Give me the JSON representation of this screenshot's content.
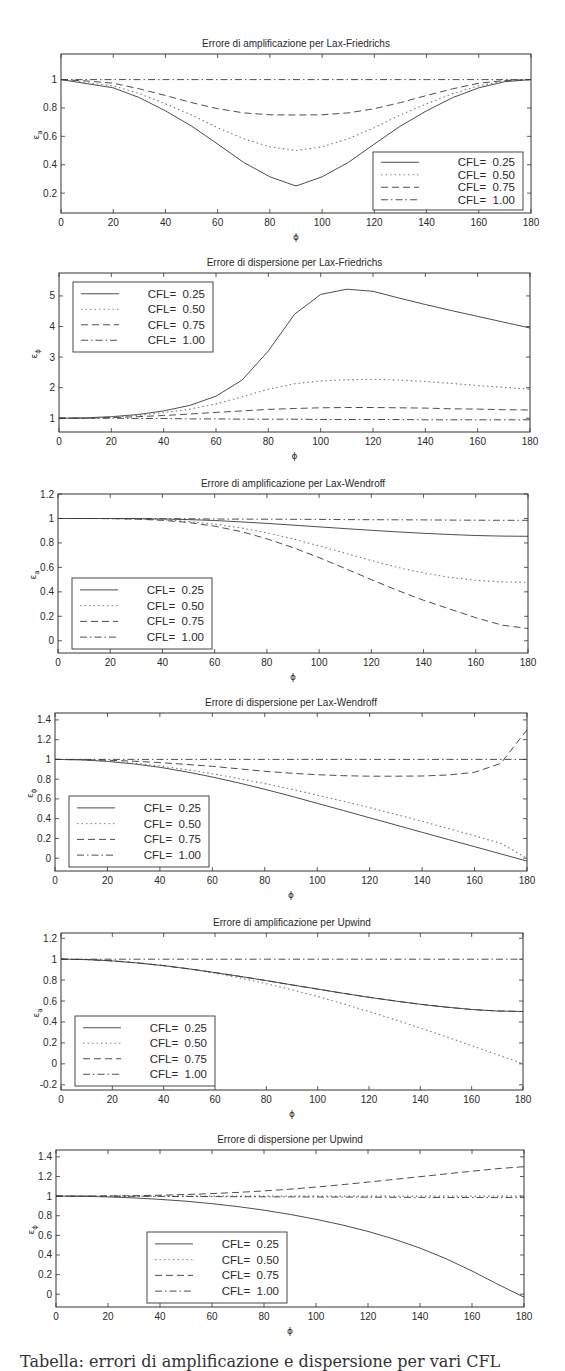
{
  "figure": {
    "caption_fragment": "Tabella: errori di amplificazione e dispersione per vari CFL"
  },
  "style": {
    "axis_color": "#333333",
    "line_color": "#3a3a3a",
    "text_color": "#2a2a2a",
    "series_dash": [
      "",
      "1.5,3",
      "7,4",
      "7,3,1.5,3"
    ]
  },
  "chart_data": [
    {
      "type": "line",
      "title": "Errore di amplificazione per Lax-Friedrichs",
      "xlabel": "ϕ",
      "ylabel": "ε_a",
      "xlim": [
        0,
        180
      ],
      "ylim": [
        0.06,
        1.18
      ],
      "xticks": [
        0,
        20,
        40,
        60,
        80,
        100,
        120,
        140,
        160,
        180
      ],
      "yticks": [
        0.2,
        0.4,
        0.6,
        0.8,
        1
      ],
      "ytick_labels": [
        "0.2",
        "0.4",
        "0.6",
        "0.8",
        "1"
      ],
      "legend_position": "lower right",
      "box": {
        "top": 54,
        "left": 61,
        "right": 531,
        "bottom": 213
      },
      "legend_box": {
        "x": 373,
        "y": 152,
        "w": 150,
        "h": 58
      },
      "x": [
        0,
        10,
        20,
        30,
        40,
        50,
        60,
        70,
        80,
        90,
        100,
        110,
        120,
        130,
        140,
        150,
        160,
        170,
        180
      ],
      "series": [
        {
          "name": "CFL=  0.25",
          "values": [
            1.0,
            0.971,
            0.942,
            0.873,
            0.78,
            0.672,
            0.545,
            0.416,
            0.315,
            0.25,
            0.315,
            0.416,
            0.545,
            0.672,
            0.78,
            0.873,
            0.942,
            0.985,
            1.0
          ]
        },
        {
          "name": "CFL=  0.50",
          "values": [
            1.0,
            0.978,
            0.956,
            0.901,
            0.829,
            0.751,
            0.661,
            0.583,
            0.526,
            0.5,
            0.526,
            0.583,
            0.661,
            0.751,
            0.829,
            0.901,
            0.956,
            0.989,
            1.0
          ]
        },
        {
          "name": "CFL=  0.75",
          "values": [
            1.0,
            0.99,
            0.974,
            0.935,
            0.888,
            0.838,
            0.795,
            0.765,
            0.752,
            0.75,
            0.752,
            0.765,
            0.795,
            0.838,
            0.888,
            0.935,
            0.974,
            0.993,
            1.0
          ]
        },
        {
          "name": "CFL=  1.00",
          "values": [
            1.0,
            1.0,
            1.0,
            1.0,
            1.0,
            1.0,
            1.0,
            1.0,
            1.0,
            1.0,
            1.0,
            1.0,
            1.0,
            1.0,
            1.0,
            1.0,
            1.0,
            1.0,
            1.0
          ]
        }
      ]
    },
    {
      "type": "line",
      "title": "Errore di dispersione per Lax-Friedrichs",
      "xlabel": "ϕ",
      "ylabel": "ε_φ",
      "xlim": [
        0,
        180
      ],
      "ylim": [
        0.55,
        5.75
      ],
      "xticks": [
        0,
        20,
        40,
        60,
        80,
        100,
        120,
        140,
        160,
        180
      ],
      "yticks": [
        1,
        2,
        3,
        4,
        5
      ],
      "ytick_labels": [
        "1",
        "2",
        "3",
        "4",
        "5"
      ],
      "legend_position": "upper left",
      "box": {
        "top": 273,
        "left": 59,
        "right": 530,
        "bottom": 432
      },
      "legend_box": {
        "x": 73,
        "y": 282,
        "w": 140,
        "h": 70
      },
      "x": [
        0,
        10,
        20,
        30,
        40,
        50,
        60,
        70,
        80,
        90,
        100,
        110,
        120,
        130,
        140,
        150,
        160,
        170,
        180
      ],
      "series": [
        {
          "name": "CFL=  0.25",
          "values": [
            1.0,
            1.01,
            1.05,
            1.12,
            1.24,
            1.42,
            1.72,
            2.25,
            3.2,
            4.4,
            5.05,
            5.22,
            5.15,
            4.93,
            4.72,
            4.52,
            4.33,
            4.14,
            3.95
          ]
        },
        {
          "name": "CFL=  0.50",
          "values": [
            1.0,
            1.01,
            1.04,
            1.09,
            1.18,
            1.3,
            1.47,
            1.7,
            1.95,
            2.13,
            2.22,
            2.26,
            2.27,
            2.25,
            2.2,
            2.14,
            2.07,
            2.01,
            1.95
          ]
        },
        {
          "name": "CFL=  0.75",
          "values": [
            1.0,
            1.0,
            1.02,
            1.05,
            1.09,
            1.14,
            1.19,
            1.24,
            1.29,
            1.32,
            1.34,
            1.35,
            1.35,
            1.34,
            1.33,
            1.31,
            1.3,
            1.28,
            1.27
          ]
        },
        {
          "name": "CFL=  1.00",
          "values": [
            1.0,
            1.0,
            1.0,
            0.99,
            0.99,
            0.98,
            0.98,
            0.97,
            0.97,
            0.97,
            0.96,
            0.96,
            0.96,
            0.96,
            0.95,
            0.95,
            0.95,
            0.95,
            0.95
          ]
        }
      ]
    },
    {
      "type": "line",
      "title": "Errore di amplificazione per Lax-Wendroff",
      "xlabel": "ϕ",
      "ylabel": "ε_a",
      "xlim": [
        0,
        180
      ],
      "ylim": [
        -0.1,
        1.2
      ],
      "xticks": [
        0,
        20,
        40,
        60,
        80,
        100,
        120,
        140,
        160,
        180
      ],
      "yticks": [
        0,
        0.2,
        0.4,
        0.6,
        0.8,
        1,
        1.2
      ],
      "ytick_labels": [
        "0",
        "0.2",
        "0.4",
        "0.6",
        "0.8",
        "1",
        "1.2"
      ],
      "legend_position": "lower left",
      "box": {
        "top": 494,
        "left": 58,
        "right": 528,
        "bottom": 653
      },
      "legend_box": {
        "x": 72,
        "y": 578,
        "w": 140,
        "h": 71
      },
      "x": [
        0,
        10,
        20,
        30,
        40,
        50,
        60,
        70,
        80,
        90,
        100,
        110,
        120,
        130,
        140,
        150,
        160,
        170,
        180
      ],
      "series": [
        {
          "name": "CFL=  0.25",
          "values": [
            1.0,
            1.0,
            1.0,
            0.999,
            0.996,
            0.991,
            0.983,
            0.972,
            0.96,
            0.946,
            0.931,
            0.917,
            0.903,
            0.89,
            0.879,
            0.869,
            0.861,
            0.856,
            0.854
          ]
        },
        {
          "name": "CFL=  0.50",
          "values": [
            1.0,
            1.0,
            0.999,
            0.996,
            0.989,
            0.975,
            0.954,
            0.923,
            0.883,
            0.833,
            0.776,
            0.716,
            0.656,
            0.6,
            0.554,
            0.518,
            0.494,
            0.481,
            0.478
          ]
        },
        {
          "name": "CFL=  0.75",
          "values": [
            1.0,
            1.0,
            0.999,
            0.995,
            0.985,
            0.967,
            0.937,
            0.893,
            0.834,
            0.762,
            0.68,
            0.591,
            0.5,
            0.412,
            0.331,
            0.26,
            0.189,
            0.128,
            0.1
          ]
        },
        {
          "name": "CFL=  1.00",
          "values": [
            1.0,
            1.0,
            1.0,
            0.999,
            0.998,
            0.997,
            0.996,
            0.995,
            0.994,
            0.993,
            0.992,
            0.991,
            0.99,
            0.989,
            0.988,
            0.987,
            0.986,
            0.985,
            0.985
          ]
        }
      ]
    },
    {
      "type": "line",
      "title": "Errore di dispersione per Lax-Wendroff",
      "xlabel": "ϕ",
      "ylabel": "ε_φ",
      "xlim": [
        0,
        180
      ],
      "ylim": [
        -0.13,
        1.47
      ],
      "xticks": [
        0,
        20,
        40,
        60,
        80,
        100,
        120,
        140,
        160,
        180
      ],
      "yticks": [
        0,
        0.2,
        0.4,
        0.6,
        0.8,
        1,
        1.2,
        1.4
      ],
      "ytick_labels": [
        "0",
        "0.2",
        "0.4",
        "0.6",
        "0.8",
        "1",
        "1.2",
        "1.4"
      ],
      "legend_position": "lower left",
      "box": {
        "top": 713,
        "left": 55,
        "right": 527,
        "bottom": 871
      },
      "legend_box": {
        "x": 69,
        "y": 796,
        "w": 140,
        "h": 71
      },
      "x": [
        0,
        10,
        20,
        30,
        40,
        50,
        60,
        70,
        80,
        90,
        100,
        110,
        120,
        130,
        140,
        150,
        160,
        170,
        180
      ],
      "series": [
        {
          "name": "CFL=  0.25",
          "values": [
            1.0,
            0.995,
            0.98,
            0.955,
            0.92,
            0.875,
            0.822,
            0.762,
            0.697,
            0.628,
            0.556,
            0.483,
            0.409,
            0.336,
            0.262,
            0.189,
            0.116,
            0.043,
            -0.03
          ]
        },
        {
          "name": "CFL=  0.50",
          "values": [
            1.0,
            0.996,
            0.983,
            0.962,
            0.933,
            0.897,
            0.855,
            0.807,
            0.755,
            0.699,
            0.639,
            0.576,
            0.511,
            0.443,
            0.373,
            0.3,
            0.226,
            0.15,
            0.0
          ]
        },
        {
          "name": "CFL=  0.75",
          "values": [
            1.0,
            0.998,
            0.992,
            0.982,
            0.968,
            0.95,
            0.93,
            0.905,
            0.88,
            0.86,
            0.845,
            0.835,
            0.83,
            0.83,
            0.832,
            0.842,
            0.87,
            0.96,
            1.3
          ]
        },
        {
          "name": "CFL=  1.00",
          "values": [
            1.0,
            1.0,
            1.0,
            1.0,
            1.0,
            1.0,
            1.0,
            1.0,
            1.0,
            1.0,
            1.0,
            1.0,
            1.0,
            1.0,
            1.0,
            1.0,
            1.0,
            1.0,
            1.0
          ]
        }
      ]
    },
    {
      "type": "line",
      "title": "Errore di amplificazione per Upwind",
      "xlabel": "ϕ",
      "ylabel": "ε_a",
      "xlim": [
        0,
        180
      ],
      "ylim": [
        -0.25,
        1.25
      ],
      "xticks": [
        0,
        20,
        40,
        60,
        80,
        100,
        120,
        140,
        160,
        180
      ],
      "yticks": [
        -0.2,
        0,
        0.2,
        0.4,
        0.6,
        0.8,
        1,
        1.2
      ],
      "ytick_labels": [
        "-0.2",
        "0",
        "0.2",
        "0.4",
        "0.6",
        "0.8",
        "1",
        "1.2"
      ],
      "legend_position": "lower left",
      "box": {
        "top": 933,
        "left": 61,
        "right": 523,
        "bottom": 1090
      },
      "legend_box": {
        "x": 75,
        "y": 1016,
        "w": 140,
        "h": 70
      },
      "x": [
        0,
        10,
        20,
        30,
        40,
        50,
        60,
        70,
        80,
        90,
        100,
        110,
        120,
        130,
        140,
        150,
        160,
        170,
        180
      ],
      "series": [
        {
          "name": "CFL=  0.25",
          "values": [
            1.0,
            0.996,
            0.983,
            0.963,
            0.938,
            0.907,
            0.872,
            0.834,
            0.795,
            0.754,
            0.714,
            0.674,
            0.636,
            0.601,
            0.569,
            0.542,
            0.519,
            0.505,
            0.5
          ]
        },
        {
          "name": "CFL=  0.50",
          "values": [
            1.0,
            0.996,
            0.985,
            0.966,
            0.94,
            0.906,
            0.866,
            0.819,
            0.766,
            0.707,
            0.643,
            0.574,
            0.5,
            0.423,
            0.342,
            0.259,
            0.174,
            0.087,
            0.0
          ]
        },
        {
          "name": "CFL=  0.75",
          "values": [
            1.0,
            0.996,
            0.983,
            0.963,
            0.938,
            0.907,
            0.872,
            0.834,
            0.795,
            0.754,
            0.714,
            0.674,
            0.636,
            0.601,
            0.569,
            0.542,
            0.519,
            0.505,
            0.5
          ]
        },
        {
          "name": "CFL=  1.00",
          "values": [
            1.0,
            1.0,
            1.0,
            1.0,
            1.0,
            1.0,
            1.0,
            1.0,
            1.0,
            1.0,
            1.0,
            1.0,
            1.0,
            1.0,
            1.0,
            1.0,
            1.0,
            1.0,
            1.0
          ]
        }
      ]
    },
    {
      "type": "line",
      "title": "Errore di dispersione per Upwind",
      "xlabel": "ϕ",
      "ylabel": "ε_φ",
      "xlim": [
        0,
        180
      ],
      "ylim": [
        -0.13,
        1.47
      ],
      "xticks": [
        0,
        20,
        40,
        60,
        80,
        100,
        120,
        140,
        160,
        180
      ],
      "yticks": [
        0,
        0.2,
        0.4,
        0.6,
        0.8,
        1,
        1.2,
        1.4
      ],
      "ytick_labels": [
        "0",
        "0.2",
        "0.4",
        "0.6",
        "0.8",
        "1",
        "1.2",
        "1.4"
      ],
      "legend_position": "lower center",
      "box": {
        "top": 1150,
        "left": 56,
        "right": 524,
        "bottom": 1307
      },
      "legend_box": {
        "x": 147,
        "y": 1232,
        "w": 140,
        "h": 71
      },
      "x": [
        0,
        10,
        20,
        30,
        40,
        50,
        60,
        70,
        80,
        90,
        100,
        110,
        120,
        130,
        140,
        150,
        160,
        170,
        180
      ],
      "series": [
        {
          "name": "CFL=  0.25",
          "values": [
            1.0,
            0.998,
            0.992,
            0.982,
            0.967,
            0.948,
            0.923,
            0.893,
            0.857,
            0.814,
            0.764,
            0.707,
            0.64,
            0.562,
            0.47,
            0.362,
            0.237,
            0.1,
            -0.03
          ]
        },
        {
          "name": "CFL=  0.50",
          "values": [
            1.0,
            1.0,
            1.0,
            1.0,
            1.0,
            1.0,
            1.0,
            1.0,
            1.0,
            1.0,
            1.0,
            1.0,
            1.0,
            1.0,
            1.0,
            1.0,
            1.0,
            1.0,
            1.0
          ]
        },
        {
          "name": "CFL=  0.75",
          "values": [
            1.0,
            1.0,
            1.001,
            1.004,
            1.009,
            1.016,
            1.026,
            1.038,
            1.053,
            1.071,
            1.092,
            1.116,
            1.143,
            1.17,
            1.198,
            1.226,
            1.254,
            1.28,
            1.3
          ]
        },
        {
          "name": "CFL=  1.00",
          "values": [
            1.0,
            1.0,
            0.999,
            0.998,
            0.997,
            0.996,
            0.995,
            0.994,
            0.993,
            0.992,
            0.991,
            0.99,
            0.989,
            0.988,
            0.987,
            0.986,
            0.986,
            0.985,
            0.985
          ]
        }
      ]
    }
  ]
}
